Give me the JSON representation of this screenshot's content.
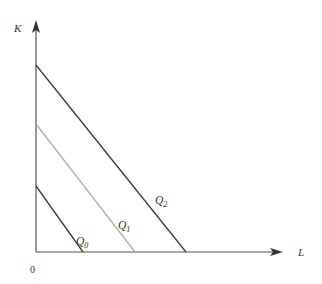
{
  "figure": {
    "background_color": "#ffffff",
    "width": 322,
    "height": 284
  },
  "axes": {
    "y_label": "K",
    "x_label": "L",
    "origin_label": "0",
    "axis_color": "#555555",
    "y_axis": {
      "x": 36,
      "y_top": 22,
      "y_bottom": 252
    },
    "x_axis": {
      "y": 252,
      "x_left": 36,
      "x_right": 282
    }
  },
  "chart_data": {
    "type": "line",
    "title": "",
    "xlabel": "L",
    "ylabel": "K",
    "xlim": [
      0,
      280
    ],
    "ylim": [
      0,
      240
    ],
    "grid": false,
    "legend_position": "inline-annotations",
    "series": [
      {
        "name": "Q_0",
        "label_text": "Q",
        "label_sub": "0",
        "color": "#3a3a3a",
        "stroke_width": 1.3,
        "y_intercept_px": 186,
        "x_intercept_px": 83,
        "points_px": [
          [
            36,
            186
          ],
          [
            83,
            252
          ]
        ],
        "label_px": [
          76,
          245
        ]
      },
      {
        "name": "Q_1",
        "label_text": "Q",
        "label_sub": "1",
        "color": "#aeaeae",
        "stroke_width": 1.3,
        "y_intercept_px": 124,
        "x_intercept_px": 135,
        "points_px": [
          [
            36,
            124
          ],
          [
            135,
            252
          ]
        ],
        "label_px": [
          118,
          229
        ]
      },
      {
        "name": "Q_2",
        "label_text": "Q",
        "label_sub": "2",
        "color": "#3a3a3a",
        "stroke_width": 1.3,
        "y_intercept_px": 65,
        "x_intercept_px": 186,
        "points_px": [
          [
            36,
            65
          ],
          [
            186,
            252
          ]
        ],
        "label_px": [
          155,
          204
        ]
      }
    ],
    "annotations": [
      {
        "text": "K",
        "role": "y-axis-title"
      },
      {
        "text": "L",
        "role": "x-axis-title"
      },
      {
        "text": "0",
        "role": "origin"
      }
    ]
  }
}
